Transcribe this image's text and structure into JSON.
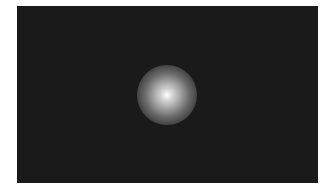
{
  "image": {
    "description": "Dark rectangular field with a single soft white radial glow near the center",
    "background_color": "#1a1a1a",
    "glow_color": "#ffffff",
    "border_color": "#ffffff"
  }
}
